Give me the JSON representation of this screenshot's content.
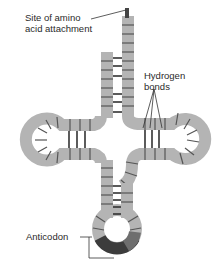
{
  "diagram": {
    "labels": {
      "amino_site_line1": "Site of amino",
      "amino_site_line2": "acid attachment",
      "hbonds_line1": "Hydrogen",
      "hbonds_line2": "bonds",
      "anticodon": "Anticodon"
    },
    "colors": {
      "strand": "#b4b4b4",
      "tick": "#555555",
      "bond": "#333333",
      "anticodon_dark": "#3c3c3c",
      "anticodon_mid": "#6e6e6e",
      "text": "#2a2a2a"
    }
  }
}
